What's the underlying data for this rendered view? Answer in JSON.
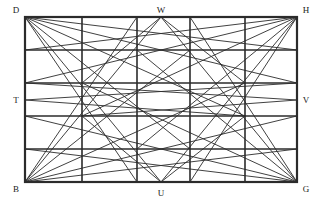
{
  "figure": {
    "title": "",
    "type": "geometric-line-diagram",
    "stroke_color": "#2b2b2b",
    "background_color": "#ffffff",
    "grid_stroke_width": 1.6,
    "diagonal_stroke_width": 0.9,
    "rect": {
      "x": 25,
      "y": 17,
      "width": 272,
      "height": 165
    },
    "grid": {
      "columns": 5,
      "rows": 5,
      "vertical_x": [
        25,
        82,
        137,
        190,
        245,
        297
      ],
      "horizontal_y": [
        17,
        50,
        83,
        116,
        149,
        182
      ]
    },
    "labels": [
      {
        "name": "D",
        "text": "D",
        "x": 16,
        "y": 13,
        "anchor": "middle"
      },
      {
        "name": "W",
        "text": "W",
        "x": 161,
        "y": 13,
        "anchor": "middle"
      },
      {
        "name": "H",
        "text": "H",
        "x": 306,
        "y": 13,
        "anchor": "middle"
      },
      {
        "name": "T",
        "text": "T",
        "x": 16,
        "y": 103,
        "anchor": "middle"
      },
      {
        "name": "V",
        "text": "V",
        "x": 306,
        "y": 103,
        "anchor": "middle"
      },
      {
        "name": "B",
        "text": "B",
        "x": 16,
        "y": 192,
        "anchor": "middle"
      },
      {
        "name": "U",
        "text": "U",
        "x": 161,
        "y": 196,
        "anchor": "middle"
      },
      {
        "name": "G",
        "text": "G",
        "x": 306,
        "y": 192,
        "anchor": "middle"
      }
    ],
    "points": {
      "D": {
        "x": 25,
        "y": 17
      },
      "W": {
        "x": 161,
        "y": 17
      },
      "H": {
        "x": 297,
        "y": 17
      },
      "T": {
        "x": 25,
        "y": 100
      },
      "V": {
        "x": 297,
        "y": 100
      },
      "B": {
        "x": 25,
        "y": 182
      },
      "U": {
        "x": 161,
        "y": 182
      },
      "G": {
        "x": 297,
        "y": 182
      }
    },
    "diagonals": [
      {
        "from": "D",
        "to_x": 297,
        "to_y": 83
      },
      {
        "from": "D",
        "to_x": 297,
        "to_y": 50
      },
      {
        "from": "D",
        "to_x": 245,
        "to_y": 116
      },
      {
        "from": "D",
        "to_x": 190,
        "to_y": 149
      },
      {
        "from": "D",
        "to_x": 161,
        "to_y": 182
      },
      {
        "from": "D",
        "to_x": 137,
        "to_y": 182
      },
      {
        "from": "H",
        "to_x": 25,
        "to_y": 83
      },
      {
        "from": "H",
        "to_x": 25,
        "to_y": 50
      },
      {
        "from": "H",
        "to_x": 82,
        "to_y": 116
      },
      {
        "from": "H",
        "to_x": 137,
        "to_y": 149
      },
      {
        "from": "H",
        "to_x": 161,
        "to_y": 182
      },
      {
        "from": "H",
        "to_x": 190,
        "to_y": 182
      },
      {
        "from": "B",
        "to_x": 297,
        "to_y": 116
      },
      {
        "from": "B",
        "to_x": 297,
        "to_y": 149
      },
      {
        "from": "B",
        "to_x": 245,
        "to_y": 83
      },
      {
        "from": "B",
        "to_x": 190,
        "to_y": 50
      },
      {
        "from": "B",
        "to_x": 161,
        "to_y": 17
      },
      {
        "from": "B",
        "to_x": 137,
        "to_y": 17
      },
      {
        "from": "G",
        "to_x": 25,
        "to_y": 116
      },
      {
        "from": "G",
        "to_x": 25,
        "to_y": 149
      },
      {
        "from": "G",
        "to_x": 82,
        "to_y": 83
      },
      {
        "from": "G",
        "to_x": 137,
        "to_y": 50
      },
      {
        "from": "G",
        "to_x": 161,
        "to_y": 17
      },
      {
        "from": "G",
        "to_x": 190,
        "to_y": 17
      },
      {
        "from": "T",
        "to_x": 297,
        "to_y": 83
      },
      {
        "from": "T",
        "to_x": 245,
        "to_y": 116
      },
      {
        "from": "V",
        "to_x": 25,
        "to_y": 83
      },
      {
        "from": "V",
        "to_x": 82,
        "to_y": 116
      },
      {
        "from": "W",
        "to_x": 82,
        "to_y": 83
      },
      {
        "from": "W",
        "to_x": 245,
        "to_y": 83
      },
      {
        "from": "U",
        "to_x": 82,
        "to_y": 116
      },
      {
        "from": "U",
        "to_x": 245,
        "to_y": 116
      }
    ]
  }
}
